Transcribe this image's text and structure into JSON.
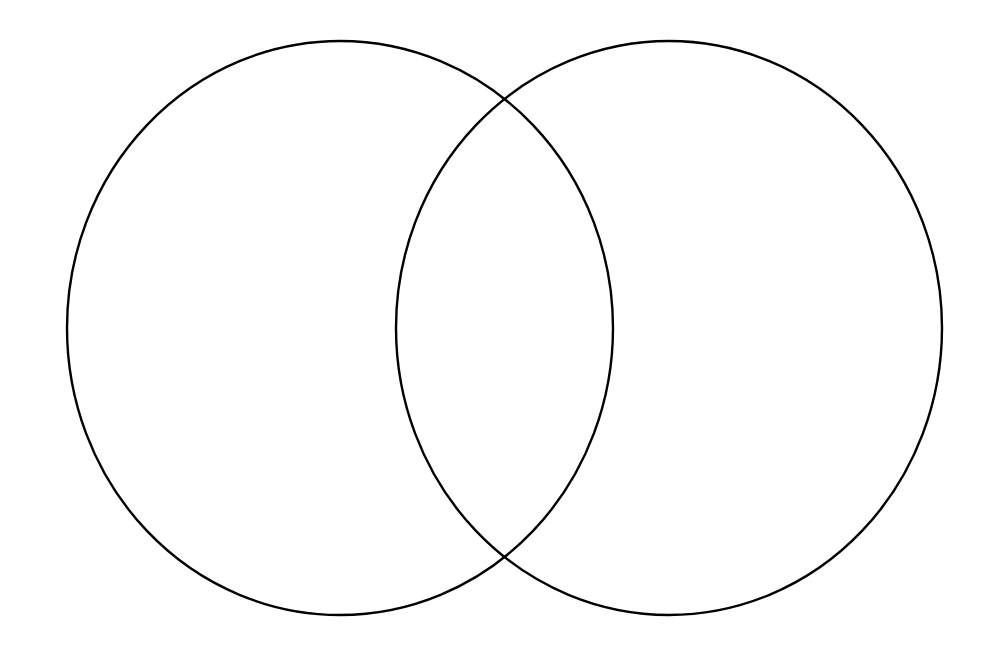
{
  "diagram": {
    "type": "venn",
    "background_color": "#ffffff",
    "stroke_color": "#000000",
    "sets": [
      {
        "id": "left-set",
        "label": "",
        "cx": 340,
        "cy": 328,
        "rx": 273,
        "ry": 287
      },
      {
        "id": "right-set",
        "label": "",
        "cx": 669,
        "cy": 328,
        "rx": 273,
        "ry": 287
      }
    ],
    "regions": {
      "left_only": "",
      "intersection": "",
      "right_only": ""
    }
  }
}
